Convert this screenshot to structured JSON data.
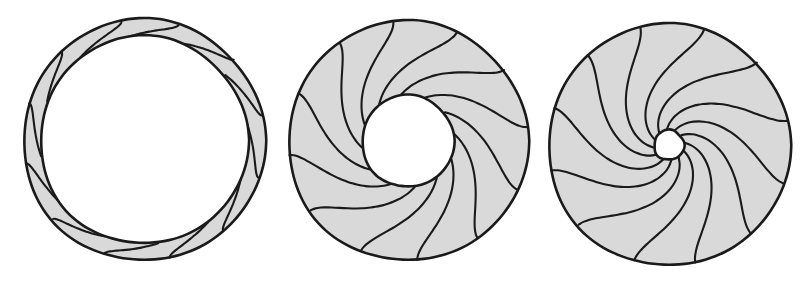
{
  "figure": {
    "canvas": {
      "width": 807,
      "height": 282
    },
    "style": {
      "fill_color": "#d9d9d9",
      "stroke_color": "#1a1a1a",
      "hub_fill_color": "#ffffff",
      "background_color": "#ffffff",
      "outer_stroke_width": 2.6,
      "blade_stroke_width": 2.1
    },
    "shapes": [
      {
        "name": "thin-annulus-disc",
        "label": "",
        "center_x": 144,
        "center_y": 140,
        "outer_radius": 121,
        "hub_radius": 104,
        "blade_count": 12,
        "blade_sweep_deg": 26,
        "spiral_direction": "counter-clockwise"
      },
      {
        "name": "medium-hub-spiral-disc",
        "label": "",
        "center_x": 408,
        "center_y": 141,
        "outer_radius": 120,
        "hub_radius": 46,
        "blade_count": 12,
        "blade_sweep_deg": 62,
        "spiral_direction": "counter-clockwise"
      },
      {
        "name": "small-hub-spiral-disc",
        "label": "",
        "center_x": 669,
        "center_y": 145,
        "outer_radius": 121,
        "hub_radius": 15,
        "blade_count": 12,
        "blade_sweep_deg": 86,
        "spiral_direction": "counter-clockwise"
      }
    ]
  },
  "chart_data": {
    "type": "diagram",
    "subtitle": "",
    "xlabel": "",
    "ylabel": "",
    "annotations": [],
    "legend": [],
    "categories": [
      "thin annulus",
      "medium hub",
      "small hub"
    ],
    "series": [
      {
        "name": "outer radius (px)",
        "values": [
          121,
          120,
          121
        ]
      },
      {
        "name": "hub radius (px)",
        "values": [
          104,
          46,
          15
        ]
      },
      {
        "name": "blade count",
        "values": [
          12,
          12,
          12
        ]
      },
      {
        "name": "blade angular sweep (deg)",
        "values": [
          26,
          62,
          86
        ]
      }
    ]
  }
}
